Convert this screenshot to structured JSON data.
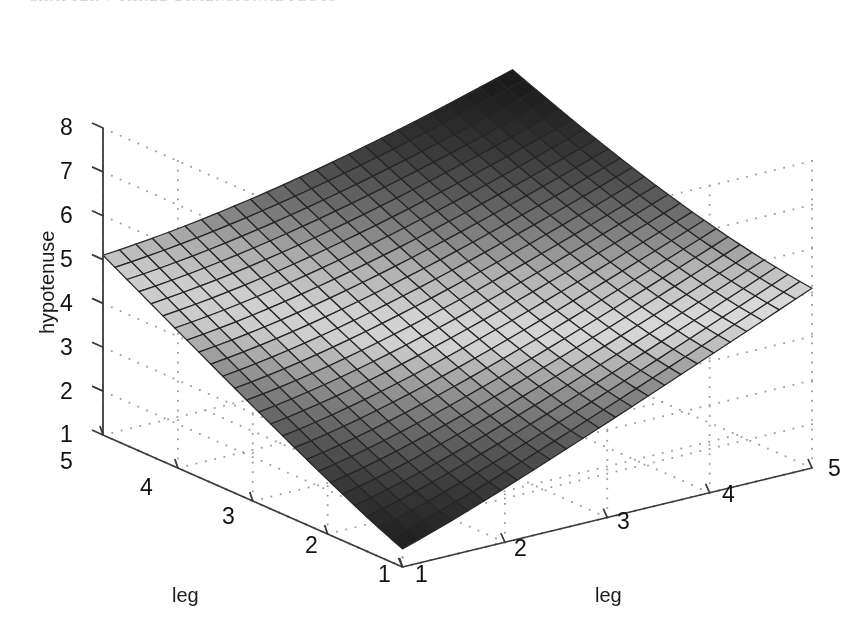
{
  "page": {
    "header_text": "CHAPTER 7  THREE-DIMENSIONAL PLOTS",
    "background_color": "#ffffff"
  },
  "figure": {
    "name": "matlab-surface-plot",
    "kind": "3d-surface-mesh"
  },
  "axes": {
    "vertical": {
      "label": "hypotenuse",
      "ticks": [
        "1",
        "2",
        "3",
        "4",
        "5",
        "6",
        "7",
        "8"
      ],
      "min": 1,
      "max": 8
    },
    "left_horizontal": {
      "label": "leg",
      "ticks": [
        "5",
        "4",
        "3",
        "2",
        "1"
      ],
      "min": 1,
      "max": 5
    },
    "right_horizontal": {
      "label": "leg",
      "ticks": [
        "1",
        "2",
        "3",
        "4",
        "5"
      ],
      "min": 1,
      "max": 5
    }
  },
  "chart_data": {
    "type": "surface",
    "title": "",
    "xlabel": "leg",
    "ylabel": "leg",
    "zlabel": "hypotenuse",
    "function": "z = sqrt(x^2 + y^2)",
    "x": [
      1,
      1.2,
      1.4,
      1.6,
      1.8,
      2,
      2.2,
      2.4,
      2.6,
      2.8,
      3,
      3.2,
      3.4,
      3.6,
      3.8,
      4,
      4.2,
      4.4,
      4.6,
      4.8,
      5
    ],
    "y": [
      1,
      1.2,
      1.4,
      1.6,
      1.8,
      2,
      2.2,
      2.4,
      2.6,
      2.8,
      3,
      3.2,
      3.4,
      3.6,
      3.8,
      4,
      4.2,
      4.4,
      4.6,
      4.8,
      5
    ],
    "xlim": [
      1,
      5
    ],
    "ylim": [
      1,
      5
    ],
    "zlim": [
      1,
      8
    ],
    "xticks": [
      1,
      2,
      3,
      4,
      5
    ],
    "yticks": [
      1,
      2,
      3,
      4,
      5
    ],
    "zticks": [
      1,
      2,
      3,
      4,
      5,
      6,
      7,
      8
    ],
    "grid": true,
    "grid_style": "dotted",
    "colormap": "gray",
    "mesh_lines": true,
    "corner_values": {
      "leg1_1_leg2_1": 1.41,
      "leg1_5_leg2_1": 5.1,
      "leg1_1_leg2_5": 5.1,
      "leg1_5_leg2_5": 7.07
    },
    "legend": null,
    "view": {
      "azimuth": -37.5,
      "elevation": 30
    }
  },
  "colors": {
    "axis_line": "#3a3a3a",
    "grid_dot": "#9a9aa0",
    "mesh_line": "#262626",
    "surface_light": "#e9e9e9",
    "surface_dark": "#171717",
    "text": "#121212"
  }
}
